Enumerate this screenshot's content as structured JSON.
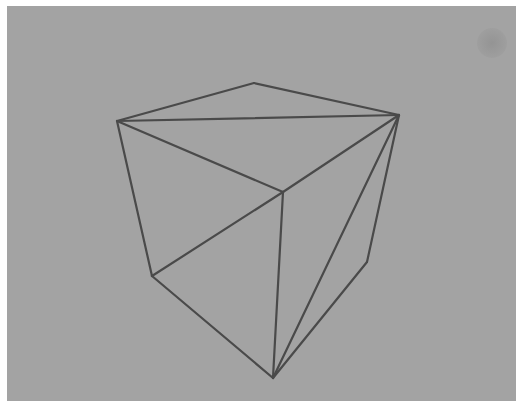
{
  "scene": {
    "background_color": "#a3a3a3",
    "line_color": "#4a4a4a",
    "object": "wireframe-cube",
    "vertices": {
      "top_back": [
        254,
        83
      ],
      "top_left": [
        117,
        121
      ],
      "top_right": [
        399,
        115
      ],
      "top_front": [
        283,
        192
      ],
      "bottom_left": [
        152,
        276
      ],
      "bottom_right": [
        367,
        262
      ],
      "bottom_front": [
        273,
        378
      ]
    },
    "edges": [
      [
        "top_left",
        "top_back"
      ],
      [
        "top_back",
        "top_right"
      ],
      [
        "top_left",
        "top_right"
      ],
      [
        "top_left",
        "top_front"
      ],
      [
        "top_right",
        "top_front"
      ],
      [
        "top_left",
        "bottom_left"
      ],
      [
        "top_front",
        "bottom_left"
      ],
      [
        "top_front",
        "bottom_front"
      ],
      [
        "bottom_left",
        "bottom_front"
      ],
      [
        "top_right",
        "bottom_right"
      ],
      [
        "bottom_right",
        "bottom_front"
      ],
      [
        "top_right",
        "bottom_front"
      ]
    ]
  }
}
